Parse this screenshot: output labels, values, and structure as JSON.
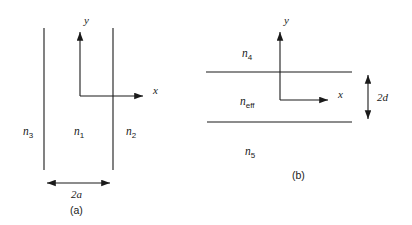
{
  "figure": {
    "width": 412,
    "height": 225,
    "background": "#ffffff",
    "stroke_color": "#1a1a1a"
  },
  "panel_a": {
    "caption": "(a)",
    "axis_y_label": "y",
    "axis_x_label": "x",
    "region_left": {
      "symbol": "n",
      "subscript": "3"
    },
    "region_center": {
      "symbol": "n",
      "subscript": "1"
    },
    "region_right": {
      "symbol": "n",
      "subscript": "2"
    },
    "dimension_label": "2a",
    "dimension_value": "2a",
    "boundary_left_x": 44,
    "boundary_right_x": 113,
    "boundary_top_y": 28,
    "boundary_bottom_y": 170,
    "origin_x": 80,
    "origin_y": 96
  },
  "panel_b": {
    "caption": "(b)",
    "axis_y_label": "y",
    "axis_x_label": "x",
    "region_top": {
      "symbol": "n",
      "subscript": "4"
    },
    "region_middle": {
      "symbol": "n",
      "subscript": "eff"
    },
    "region_bottom": {
      "symbol": "n",
      "subscript": "5"
    },
    "dimension_label": "2d",
    "dimension_value": "2d",
    "boundary_top_y": 72,
    "boundary_bottom_y": 122,
    "boundary_left_x": 206,
    "boundary_right_x": 352,
    "origin_x": 280,
    "origin_y": 100,
    "dimension_line_x": 368
  }
}
